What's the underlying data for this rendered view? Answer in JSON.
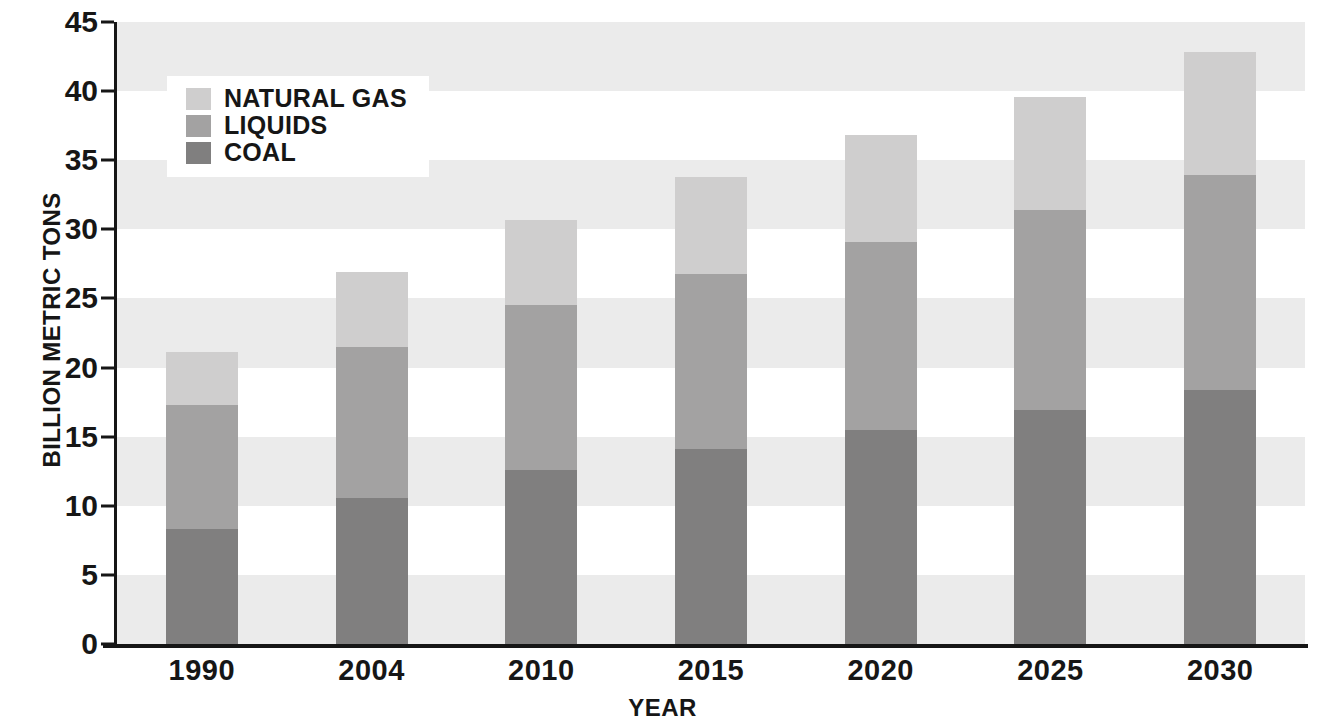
{
  "chart_data": {
    "type": "bar",
    "subtype": "stacked-vertical",
    "title": "",
    "xlabel": "YEAR",
    "ylabel": "BILLION METRIC TONS",
    "categories": [
      "1990",
      "2004",
      "2010",
      "2015",
      "2020",
      "2025",
      "2030"
    ],
    "ylim": [
      0,
      45
    ],
    "ytick_step": 5,
    "yticks": [
      "0",
      "5",
      "10",
      "15",
      "20",
      "25",
      "30",
      "35",
      "40",
      "45"
    ],
    "grid": "alternating-horizontal-bands",
    "legend_position": "upper-left-inside",
    "series": [
      {
        "name": "COAL",
        "color": "#807f7f",
        "values": [
          8.3,
          10.6,
          12.6,
          14.1,
          15.5,
          16.9,
          18.4
        ]
      },
      {
        "name": "LIQUIDS",
        "color": "#a3a2a2",
        "values": [
          9.0,
          10.9,
          11.9,
          12.7,
          13.6,
          14.5,
          15.5
        ]
      },
      {
        "name": "NATURAL GAS",
        "color": "#cfcece",
        "values": [
          3.8,
          5.4,
          6.2,
          7.0,
          7.7,
          8.2,
          8.9
        ]
      }
    ],
    "totals": [
      21.1,
      26.9,
      30.7,
      33.8,
      36.8,
      39.6,
      42.8
    ],
    "cumulative_tops": {
      "coal": [
        8.3,
        10.6,
        12.6,
        14.1,
        15.5,
        16.9,
        18.4
      ],
      "liquids": [
        17.3,
        21.5,
        24.5,
        26.8,
        29.1,
        31.4,
        33.9
      ],
      "natural_gas": [
        21.1,
        26.9,
        30.7,
        33.8,
        36.8,
        39.6,
        42.8
      ]
    }
  },
  "legend": {
    "entries": [
      {
        "label": "NATURAL GAS",
        "color": "#cfcece"
      },
      {
        "label": "LIQUIDS",
        "color": "#a3a2a2"
      },
      {
        "label": "COAL",
        "color": "#807f7f"
      }
    ]
  },
  "axes": {
    "y_title": "BILLION METRIC TONS",
    "x_title": "YEAR"
  },
  "colors": {
    "axis": "#161616",
    "band_shaded": "#ebebeb",
    "band_plain": "#ffffff",
    "natural_gas": "#cfcece",
    "liquids": "#a3a2a2",
    "coal": "#807f7f"
  }
}
